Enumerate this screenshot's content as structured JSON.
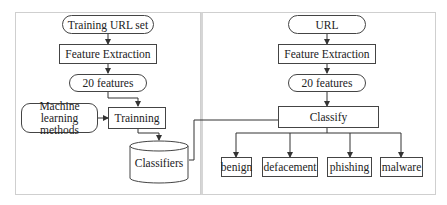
{
  "training_pipeline": {
    "input": "Training URL set",
    "feature_extraction": "Feature Extraction",
    "features": "20 features",
    "ml_methods": "Machine learning methods",
    "training": "Trainning",
    "classifiers": "Classifiers"
  },
  "classification_pipeline": {
    "input": "URL",
    "feature_extraction": "Feature Extraction",
    "features": "20 features",
    "classify": "Classify",
    "outputs": [
      "benign",
      "defacement",
      "phishing",
      "malware"
    ]
  }
}
